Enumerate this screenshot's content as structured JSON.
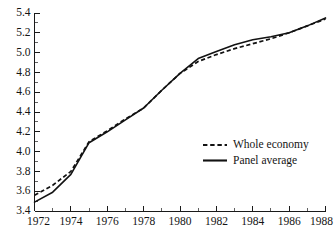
{
  "chart_data": {
    "type": "line",
    "title": "",
    "subtitle": "",
    "xlabel": "",
    "ylabel": "",
    "xlim": [
      1972,
      1988
    ],
    "ylim": [
      3.4,
      5.4
    ],
    "grid": false,
    "legend_position": "center-right",
    "y_ticks": [
      "3.4",
      "3.6",
      "3.8",
      "4.0",
      "4.2",
      "4.4",
      "4.6",
      "4.8",
      "5.0",
      "5.2",
      "5.4"
    ],
    "y_tick_values": [
      3.4,
      3.6,
      3.8,
      4.0,
      4.2,
      4.4,
      4.6,
      4.8,
      5.0,
      5.2,
      5.4
    ],
    "y_minor_step": 0.1,
    "x_ticks": [
      "1972",
      "1974",
      "1976",
      "1978",
      "1980",
      "1982",
      "1984",
      "1986",
      "1988"
    ],
    "x_tick_values": [
      1972,
      1974,
      1976,
      1978,
      1980,
      1982,
      1984,
      1986,
      1988
    ],
    "x_minor_step": 1,
    "x": [
      1972,
      1973,
      1974,
      1975,
      1976,
      1977,
      1978,
      1979,
      1980,
      1981,
      1982,
      1983,
      1984,
      1985,
      1986,
      1987,
      1988
    ],
    "series": [
      {
        "name": "Whole economy",
        "style": "dashed",
        "color": "#121212",
        "values": [
          3.56,
          3.66,
          3.8,
          4.1,
          4.21,
          4.33,
          4.44,
          4.62,
          4.79,
          4.91,
          4.98,
          5.04,
          5.09,
          5.14,
          5.2,
          5.27,
          5.34
        ]
      },
      {
        "name": "Panel average",
        "style": "solid",
        "color": "#121212",
        "values": [
          3.49,
          3.59,
          3.77,
          4.09,
          4.2,
          4.32,
          4.44,
          4.62,
          4.79,
          4.94,
          5.01,
          5.08,
          5.13,
          5.16,
          5.2,
          5.27,
          5.35
        ]
      }
    ],
    "annotations": []
  },
  "legend": {
    "entries": [
      {
        "label": "Whole economy",
        "style": "dashed"
      },
      {
        "label": "Panel average",
        "style": "solid"
      }
    ]
  }
}
